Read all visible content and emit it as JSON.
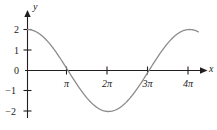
{
  "figure": {
    "kind": "cartesian-plot",
    "background_color": "#ffffff",
    "axis_color": "#231f20",
    "curve_color": "#8c8c8c",
    "text_color": "#1a1a1a"
  },
  "axes": {
    "x_axis_name": "x",
    "y_axis_name": "y",
    "x_tick_labels": [
      "π",
      "2π",
      "3π",
      "4π"
    ],
    "y_tick_labels": [
      "2",
      "1",
      "0",
      "−1",
      "−2"
    ]
  },
  "chart_data": {
    "type": "line",
    "title": "",
    "xlabel": "x",
    "ylabel": "y",
    "function": "y = 2 cos(x/2)",
    "xlim": [
      0,
      13.6
    ],
    "ylim": [
      -2.4,
      2.4
    ],
    "grid": false,
    "legend": null,
    "xticks": [
      3.141593,
      6.283185,
      9.424778,
      12.566371
    ],
    "xticklabels": [
      "π",
      "2π",
      "3π",
      "4π"
    ],
    "yticks": [
      2,
      1,
      0,
      -1,
      -2
    ],
    "yticklabels": [
      "2",
      "1",
      "0",
      "−1",
      "−2"
    ],
    "series": [
      {
        "name": "y = 2 cos(x/2)",
        "color": "#8c8c8c",
        "x": [
          0.0,
          0.4,
          0.8,
          1.2,
          1.6,
          2.0,
          2.4,
          2.8,
          3.141593,
          3.6,
          4.0,
          4.4,
          4.8,
          5.2,
          5.6,
          6.0,
          6.283185,
          6.8,
          7.2,
          7.6,
          8.0,
          8.4,
          8.8,
          9.2,
          9.424778,
          9.8,
          10.2,
          10.6,
          11.0,
          11.4,
          11.8,
          12.2,
          12.566371,
          13.0
        ],
        "y": [
          2.0,
          1.96,
          1.84,
          1.65,
          1.4,
          1.08,
          0.73,
          0.34,
          0.0,
          -0.58,
          -0.91,
          -1.2,
          -1.46,
          -1.67,
          -1.83,
          -1.94,
          -2.0,
          -1.92,
          -1.81,
          -1.65,
          -1.46,
          -1.23,
          -0.97,
          -0.69,
          -0.5,
          -0.1,
          0.28,
          0.64,
          0.96,
          1.24,
          1.48,
          1.67,
          1.8,
          1.94
        ]
      }
    ]
  }
}
